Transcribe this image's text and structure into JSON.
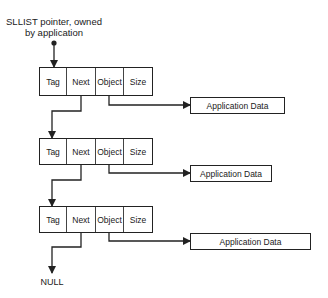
{
  "diagram": {
    "title_lines": [
      "SLLIST pointer, owned",
      "by application"
    ],
    "node_fields": [
      "Tag",
      "Next",
      "Object",
      "Size"
    ],
    "nodes": [
      {
        "fields": [
          "Tag",
          "Next",
          "Object",
          "Size"
        ],
        "points_to": "Application Data"
      },
      {
        "fields": [
          "Tag",
          "Next",
          "Object",
          "Size"
        ],
        "points_to": "Application Data"
      },
      {
        "fields": [
          "Tag",
          "Next",
          "Object",
          "Size"
        ],
        "points_to": "Application Data"
      }
    ],
    "app_data": [
      "Application Data",
      "Application Data",
      "Application Data"
    ],
    "terminator": "NULL",
    "colors": {
      "line": "#222222",
      "background": "#ffffff"
    }
  }
}
